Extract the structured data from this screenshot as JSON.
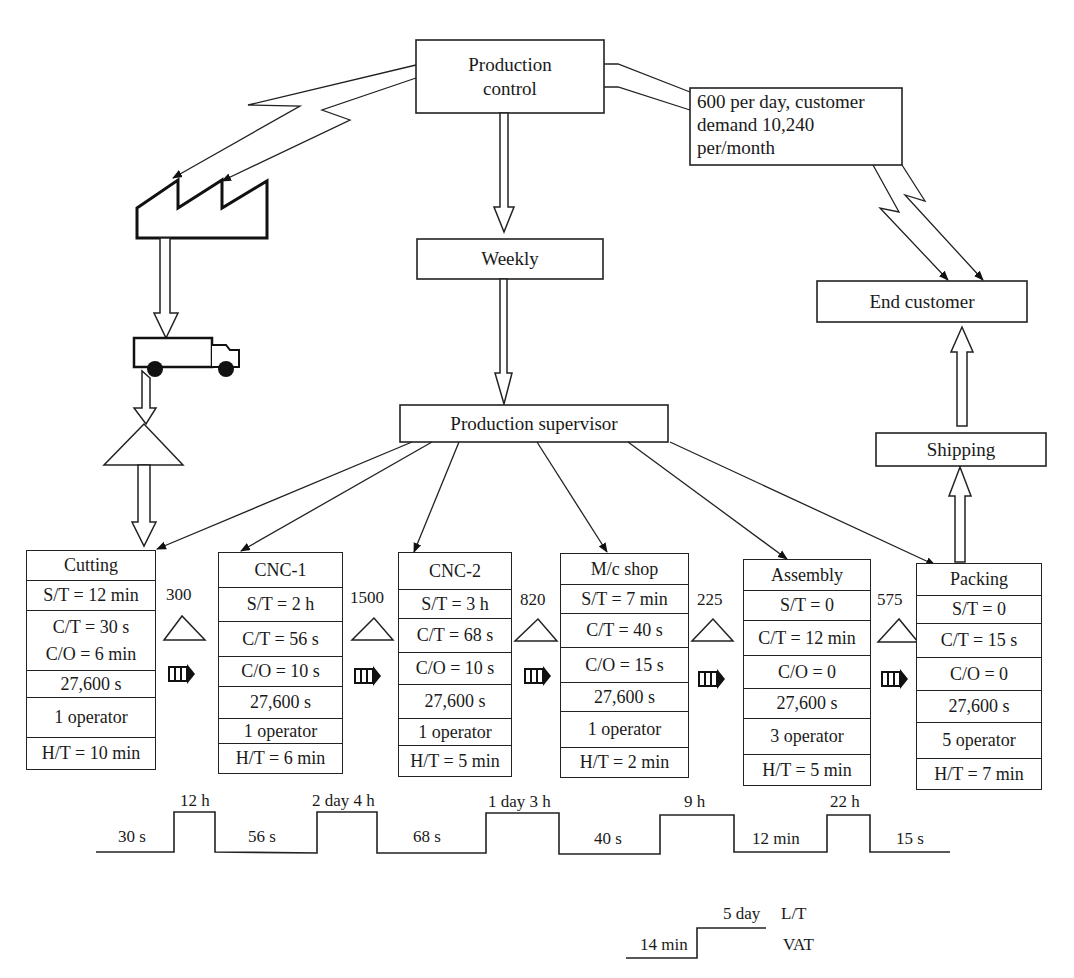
{
  "production_control": {
    "label_line1": "Production",
    "label_line2": "control"
  },
  "customer_demand": {
    "line1": "600 per day, customer",
    "line2": "demand 10,240",
    "line3": "per/month"
  },
  "schedule": {
    "label": "Weekly"
  },
  "production_supervisor": {
    "label": "Production supervisor"
  },
  "end_customer": {
    "label": "End customer"
  },
  "shipping": {
    "label": "Shipping"
  },
  "icons": {
    "supplier": "factory-icon",
    "truck": "truck-icon",
    "inventory": "inventory-triangle-icon",
    "push": "push-arrow-icon",
    "electronic_info": "lightning-arrow-icon"
  },
  "processes": [
    {
      "name": "Cutting",
      "rows": [
        "S/T = 12 min",
        "C/T = 30 s",
        "C/O = 6 min",
        "27,600 s",
        "1 operator",
        "H/T = 10 min"
      ]
    },
    {
      "name": "CNC-1",
      "rows": [
        "S/T = 2 h",
        "C/T = 56 s",
        "C/O = 10 s",
        "27,600 s",
        "1 operator",
        "H/T = 6 min"
      ]
    },
    {
      "name": "CNC-2",
      "rows": [
        "S/T = 3 h",
        "C/T = 68 s",
        "C/O = 10 s",
        "27,600 s",
        "1 operator",
        "H/T = 5 min"
      ]
    },
    {
      "name": "M/c shop",
      "rows": [
        "S/T = 7 min",
        "C/T = 40 s",
        "C/O = 15 s",
        "27,600 s",
        "1 operator",
        "H/T = 2 min"
      ]
    },
    {
      "name": "Assembly",
      "rows": [
        "S/T = 0",
        "C/T = 12 min",
        "C/O = 0",
        "27,600 s",
        "3 operator",
        "H/T = 5 min"
      ]
    },
    {
      "name": "Packing",
      "rows": [
        "S/T = 0",
        "C/T = 15 s",
        "C/O = 0",
        "27,600 s",
        "5 operator",
        "H/T = 7 min"
      ]
    }
  ],
  "inventories": [
    "300",
    "1500",
    "820",
    "225",
    "575"
  ],
  "timeline": {
    "value_added": [
      "30 s",
      "56 s",
      "68 s",
      "40 s",
      "12 min",
      "15 s"
    ],
    "waiting": [
      "12 h",
      "2 day 4 h",
      "1 day 3 h",
      "9 h",
      "22 h"
    ]
  },
  "summary": {
    "lead_time_value": "5 day",
    "lead_time_label": "L/T",
    "vat_value": "14 min",
    "vat_label": "VAT"
  },
  "colors": {
    "line": "#222222",
    "background": "#ffffff"
  }
}
